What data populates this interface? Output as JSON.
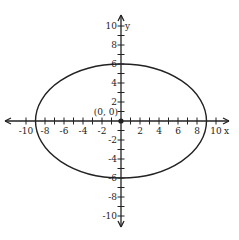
{
  "chart_data": {
    "type": "line",
    "title": "",
    "xlabel": "x",
    "ylabel": "y",
    "xlim": [
      -10,
      10
    ],
    "ylim": [
      -10,
      10
    ],
    "grid": false,
    "legend": null,
    "x_tick_labels": [
      "-10",
      "-8",
      "-6",
      "-4",
      "-2",
      "2",
      "4",
      "6",
      "8",
      "10"
    ],
    "y_tick_labels": [
      "10",
      "8",
      "6",
      "4",
      "2",
      "-2",
      "-4",
      "-6",
      "-8",
      "-10"
    ],
    "origin_label": "(0, 0)",
    "series": [
      {
        "name": "ellipse",
        "shape": "ellipse",
        "center": [
          0,
          0
        ],
        "semi_axis_x": 9,
        "semi_axis_y": 6,
        "equation": "x^2/81 + y^2/36 = 1",
        "points": [
          [
            -9,
            0
          ],
          [
            9,
            0
          ],
          [
            0,
            6
          ],
          [
            0,
            -6
          ]
        ]
      }
    ],
    "annotations": [
      {
        "text": "(0, 0)",
        "x": 0,
        "y": 0,
        "marker": "dot"
      }
    ]
  },
  "colors": {
    "axis": "#222222",
    "curve": "#222222",
    "background": "#ffffff"
  }
}
